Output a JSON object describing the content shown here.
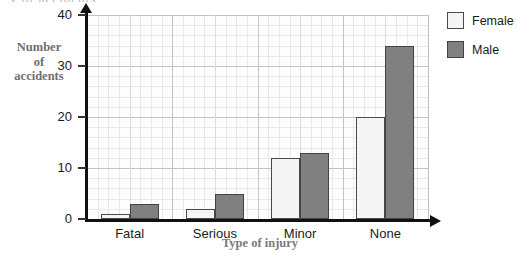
{
  "clipped_top_text": "y of accidents",
  "chart_data": {
    "type": "bar",
    "title": "",
    "xlabel": "Type of injury",
    "ylabel_lines": [
      "Number",
      "of",
      "accidents"
    ],
    "ylabel": "Number of accidents",
    "categories": [
      "Fatal",
      "Serious",
      "Minor",
      "None"
    ],
    "series": [
      {
        "name": "Female",
        "color": "#f5f5f5",
        "values": [
          1,
          2,
          12,
          20
        ]
      },
      {
        "name": "Male",
        "color": "#808080",
        "values": [
          3,
          5,
          13,
          34
        ]
      }
    ],
    "ylim": [
      0,
      40
    ],
    "yticks": [
      0,
      10,
      20,
      30,
      40
    ],
    "ytick_labels": [
      "0",
      "10",
      "20",
      "30",
      "40"
    ],
    "grid": true,
    "grid_minor_step": 2,
    "grid_major_step": 10,
    "legend_position": "right"
  },
  "legend": {
    "entries": [
      {
        "label": "Female",
        "swatch": "female"
      },
      {
        "label": "Male",
        "swatch": "male"
      }
    ]
  }
}
